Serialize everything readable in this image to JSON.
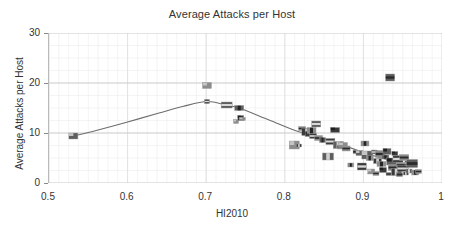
{
  "chart_data": {
    "type": "scatter",
    "title": "Average Attacks per Host",
    "xlabel": "HI2010",
    "ylabel": "Average Attacks per Host",
    "xlim": [
      0.5,
      1.0
    ],
    "ylim": [
      0,
      30
    ],
    "xticks": [
      "0.5",
      "0.6",
      "0.7",
      "0.8",
      "0.9",
      "1"
    ],
    "xtick_values": [
      0.5,
      0.6,
      0.7,
      0.8,
      0.9,
      1.0
    ],
    "yticks": [
      "0",
      "10",
      "20",
      "30"
    ],
    "ytick_values": [
      0,
      10,
      20,
      30
    ],
    "grid": true,
    "minor_grid": true,
    "legend": "none",
    "marker_style": "country-flag-thumbnail",
    "trendline": {
      "name": "fitted curve",
      "color": "#6e6e6e",
      "points": [
        {
          "x": 0.531,
          "y": 9.4
        },
        {
          "x": 0.56,
          "y": 10.5
        },
        {
          "x": 0.6,
          "y": 12.2
        },
        {
          "x": 0.64,
          "y": 14.0
        },
        {
          "x": 0.67,
          "y": 15.3
        },
        {
          "x": 0.701,
          "y": 16.3
        },
        {
          "x": 0.725,
          "y": 15.6
        },
        {
          "x": 0.742,
          "y": 15.0
        },
        {
          "x": 0.78,
          "y": 12.6
        },
        {
          "x": 0.815,
          "y": 10.4
        },
        {
          "x": 0.832,
          "y": 9.7
        },
        {
          "x": 0.855,
          "y": 8.6
        },
        {
          "x": 0.875,
          "y": 7.5
        },
        {
          "x": 0.895,
          "y": 6.4
        },
        {
          "x": 0.912,
          "y": 5.5
        },
        {
          "x": 0.93,
          "y": 4.7
        },
        {
          "x": 0.948,
          "y": 4.0
        }
      ]
    },
    "points": [
      {
        "x": 0.531,
        "y": 9.4
      },
      {
        "x": 0.701,
        "y": 19.5
      },
      {
        "x": 0.701,
        "y": 16.3
      },
      {
        "x": 0.726,
        "y": 15.6
      },
      {
        "x": 0.738,
        "y": 12.3
      },
      {
        "x": 0.742,
        "y": 15.0
      },
      {
        "x": 0.744,
        "y": 13.0
      },
      {
        "x": 0.746,
        "y": 12.8
      },
      {
        "x": 0.812,
        "y": 7.6
      },
      {
        "x": 0.818,
        "y": 7.5
      },
      {
        "x": 0.822,
        "y": 10.9
      },
      {
        "x": 0.828,
        "y": 10.2
      },
      {
        "x": 0.831,
        "y": 9.8
      },
      {
        "x": 0.834,
        "y": 10.5
      },
      {
        "x": 0.836,
        "y": 9.4
      },
      {
        "x": 0.84,
        "y": 11.8
      },
      {
        "x": 0.843,
        "y": 9.0
      },
      {
        "x": 0.848,
        "y": 8.6
      },
      {
        "x": 0.855,
        "y": 5.3
      },
      {
        "x": 0.858,
        "y": 8.3
      },
      {
        "x": 0.864,
        "y": 10.6
      },
      {
        "x": 0.868,
        "y": 7.6
      },
      {
        "x": 0.871,
        "y": 7.2
      },
      {
        "x": 0.874,
        "y": 7.6
      },
      {
        "x": 0.878,
        "y": 6.9
      },
      {
        "x": 0.884,
        "y": 3.6
      },
      {
        "x": 0.89,
        "y": 6.2
      },
      {
        "x": 0.895,
        "y": 6.0
      },
      {
        "x": 0.898,
        "y": 3.3
      },
      {
        "x": 0.902,
        "y": 7.9
      },
      {
        "x": 0.905,
        "y": 5.6
      },
      {
        "x": 0.908,
        "y": 5.0
      },
      {
        "x": 0.91,
        "y": 2.3
      },
      {
        "x": 0.914,
        "y": 6.2
      },
      {
        "x": 0.916,
        "y": 1.9
      },
      {
        "x": 0.918,
        "y": 4.4
      },
      {
        "x": 0.921,
        "y": 5.8
      },
      {
        "x": 0.923,
        "y": 3.8
      },
      {
        "x": 0.925,
        "y": 2.6
      },
      {
        "x": 0.928,
        "y": 5.2
      },
      {
        "x": 0.93,
        "y": 6.3
      },
      {
        "x": 0.932,
        "y": 1.8
      },
      {
        "x": 0.934,
        "y": 21.1
      },
      {
        "x": 0.936,
        "y": 4.3
      },
      {
        "x": 0.938,
        "y": 3.1
      },
      {
        "x": 0.94,
        "y": 5.9
      },
      {
        "x": 0.942,
        "y": 2.2
      },
      {
        "x": 0.944,
        "y": 4.8
      },
      {
        "x": 0.946,
        "y": 1.7
      },
      {
        "x": 0.948,
        "y": 3.6
      },
      {
        "x": 0.95,
        "y": 2.9
      },
      {
        "x": 0.952,
        "y": 5.1
      },
      {
        "x": 0.954,
        "y": 1.9
      },
      {
        "x": 0.956,
        "y": 4.0
      },
      {
        "x": 0.958,
        "y": 2.4
      },
      {
        "x": 0.962,
        "y": 3.9
      },
      {
        "x": 0.966,
        "y": 2.1
      },
      {
        "x": 0.97,
        "y": 2.3
      }
    ]
  },
  "colors": {
    "background": "#ffffff",
    "text": "#333333",
    "grid_major": "#c9c9c9",
    "grid_minor": "#ededed",
    "axis": "#b9b9b9",
    "trendline": "#6e6e6e",
    "marker": "#4a4a4a"
  }
}
